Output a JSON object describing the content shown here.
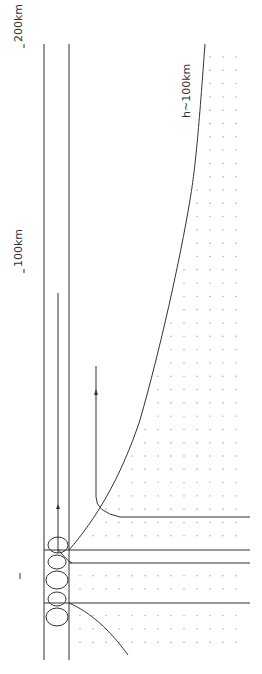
{
  "diagram": {
    "labels": {
      "scale_200km": "200km",
      "scale_100km": "100km",
      "curve_label": "h~100km",
      "left_tick": "I"
    },
    "colors": {
      "line": "#333333",
      "dots": "#9a9a9a",
      "background": "#ffffff"
    },
    "ellipse_count": 5,
    "arrows": [
      "up-arrow-left-channel",
      "up-arrow-hook-curve"
    ]
  }
}
